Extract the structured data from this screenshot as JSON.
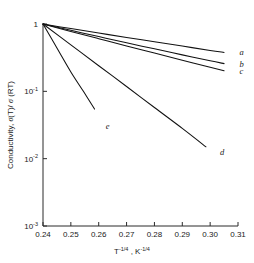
{
  "chart_data": {
    "type": "line",
    "title": "",
    "xlabel": "T^-1/4 , K^-1/4",
    "ylabel": "Conductivity, σ(T)/ σ (RT)",
    "xlim": [
      0.24,
      0.31
    ],
    "ylim": [
      0.001,
      1
    ],
    "yscale": "log",
    "xscale": "linear",
    "grid": false,
    "legend": "inline-curve-labels-right",
    "xticks": [
      "0.24",
      "0.25",
      "0.26",
      "0.27",
      "0.28",
      "0.29",
      "0.30",
      "0.31"
    ],
    "xtick_values": [
      0.24,
      0.25,
      0.26,
      0.27,
      0.28,
      0.29,
      0.3,
      0.31
    ],
    "ytick_values": [
      1,
      0.1,
      0.01,
      0.001
    ],
    "yticks": [
      {
        "mantissa": "1",
        "exponent": ""
      },
      {
        "mantissa": "10",
        "exponent": "-1"
      },
      {
        "mantissa": "10",
        "exponent": "-2"
      },
      {
        "mantissa": "10",
        "exponent": "-3"
      }
    ],
    "series": [
      {
        "name": "a",
        "label": "a",
        "x": [
          0.24,
          0.25,
          0.26,
          0.27,
          0.28,
          0.29,
          0.3,
          0.305
        ],
        "y": [
          1.0,
          0.855,
          0.735,
          0.63,
          0.545,
          0.47,
          0.405,
          0.378
        ]
      },
      {
        "name": "b",
        "label": "b",
        "x": [
          0.24,
          0.25,
          0.26,
          0.27,
          0.28,
          0.29,
          0.3,
          0.305
        ],
        "y": [
          1.0,
          0.805,
          0.65,
          0.525,
          0.428,
          0.348,
          0.284,
          0.258
        ]
      },
      {
        "name": "c",
        "label": "c",
        "x": [
          0.24,
          0.25,
          0.26,
          0.27,
          0.28,
          0.29,
          0.3,
          0.305
        ],
        "y": [
          1.0,
          0.775,
          0.605,
          0.472,
          0.37,
          0.29,
          0.228,
          0.202
        ]
      },
      {
        "name": "d",
        "label": "d",
        "x": [
          0.24,
          0.25,
          0.26,
          0.27,
          0.28,
          0.29,
          0.2985
        ],
        "y": [
          1.0,
          0.49,
          0.24,
          0.118,
          0.0575,
          0.0282,
          0.015
        ]
      },
      {
        "name": "e",
        "label": "e",
        "x": [
          0.24,
          0.245,
          0.25,
          0.2545,
          0.2585
        ],
        "y": [
          1.0,
          0.44,
          0.194,
          0.1,
          0.0545
        ]
      }
    ],
    "curve_labels": [
      {
        "text": "a",
        "x": 0.3105,
        "y": 0.38
      },
      {
        "text": "b",
        "x": 0.3105,
        "y": 0.258
      },
      {
        "text": "c",
        "x": 0.3105,
        "y": 0.2
      },
      {
        "text": "d",
        "x": 0.3035,
        "y": 0.0125
      },
      {
        "text": "e",
        "x": 0.2625,
        "y": 0.031
      }
    ]
  }
}
